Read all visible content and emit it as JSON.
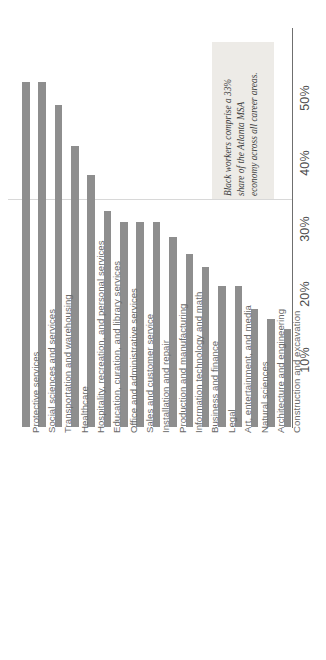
{
  "chart_data": {
    "type": "bar",
    "orientation": "horizontal-rotated",
    "title": "",
    "subtitle": "",
    "xlabel": "",
    "ylabel": "",
    "value_axis_ticks": [
      "10%",
      "20%",
      "30%",
      "40%",
      "50%"
    ],
    "value_axis_tick_values": [
      10,
      20,
      30,
      40,
      50
    ],
    "xlim": [
      0,
      55
    ],
    "grid": false,
    "reference_line": {
      "value": 33,
      "label": "33% share"
    },
    "legend": null,
    "categories": [
      "Protective services",
      "Social sciences and services",
      "Transportation and warehousing",
      "Healthcare",
      "Hospitality, recreation, and personal services",
      "Education, curation, and library services",
      "Office and administrative services",
      "Sales and customer service",
      "Installation and repair",
      "Production and manufacturing",
      "Information technology and math",
      "Business and finance",
      "Legal",
      "Art, entertainment, and media",
      "Natural sciences",
      "Architecture and engineering",
      "Construction and excavation"
    ],
    "values": [
      52.7,
      52.7,
      49.2,
      43.0,
      38.5,
      33.0,
      31.4,
      31.4,
      31.4,
      29.0,
      26.5,
      24.5,
      21.5,
      21.5,
      18.0,
      16.5,
      15.0
    ],
    "bar_color": "#8e8e8e",
    "annotation": {
      "lines": [
        "Black workers comprise a 33%",
        "share of the Atlanta MSA",
        "economy across all career areas."
      ],
      "background": "#edebe7"
    }
  }
}
